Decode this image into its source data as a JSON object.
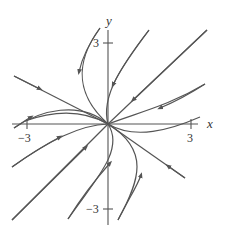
{
  "diagram": {
    "type": "phase-portrait",
    "axes": {
      "x_label": "x",
      "y_label": "y",
      "x_ticks": [
        {
          "value": -3,
          "label": "−3"
        },
        {
          "value": 3,
          "label": "3"
        }
      ],
      "y_ticks": [
        {
          "value": 3,
          "label": "3"
        },
        {
          "value": -3,
          "label": "−3"
        }
      ]
    },
    "colors": {
      "curve": "#555555",
      "axis": "#555555",
      "background": "#ffffff"
    }
  }
}
